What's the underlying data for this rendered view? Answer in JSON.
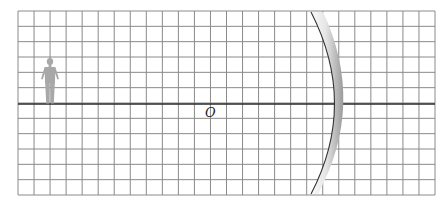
{
  "diagram": {
    "type": "optics-concave-mirror",
    "grid": {
      "left": 18,
      "top": 11,
      "right": 435,
      "bottom": 195,
      "columns": 26,
      "rows": 12,
      "line_color": "#8a8a8a"
    },
    "principal_axis": {
      "y": 104,
      "color": "#2a2a2a"
    },
    "pole_label": {
      "text": "O",
      "x": 205,
      "y": 106
    },
    "object": {
      "name": "person",
      "color": "#a8a8a8"
    },
    "mirror": {
      "kind": "concave",
      "color_light": "#f2f2f2",
      "color_dark": "#9a9a9a",
      "edge_color": "#333333"
    }
  }
}
